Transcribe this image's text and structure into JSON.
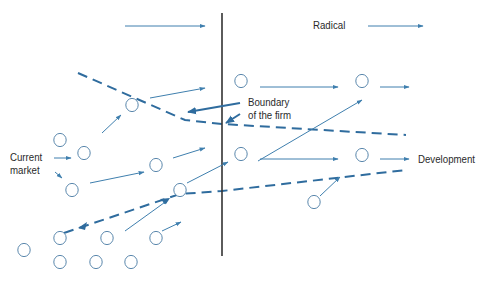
{
  "diagram": {
    "labels": {
      "radical": "Radical",
      "boundary_line1": "Boundary",
      "boundary_line2": "of the firm",
      "current_line1": "Current",
      "current_line2": "market",
      "development": "Development"
    },
    "colors": {
      "arrow": "#3f7fae",
      "dashed": "#2f6c9e",
      "circle": "#5b88ad",
      "boundary_line": "#333333",
      "text": "#2a2a2a"
    },
    "circles": [
      {
        "x": 132,
        "y": 105
      },
      {
        "x": 241,
        "y": 81
      },
      {
        "x": 362,
        "y": 81
      },
      {
        "x": 60,
        "y": 140
      },
      {
        "x": 84,
        "y": 153
      },
      {
        "x": 72,
        "y": 190
      },
      {
        "x": 156,
        "y": 165
      },
      {
        "x": 180,
        "y": 190
      },
      {
        "x": 241,
        "y": 154
      },
      {
        "x": 362,
        "y": 155
      },
      {
        "x": 314,
        "y": 202
      },
      {
        "x": 60,
        "y": 238
      },
      {
        "x": 107,
        "y": 238
      },
      {
        "x": 156,
        "y": 238
      },
      {
        "x": 24,
        "y": 250
      },
      {
        "x": 60,
        "y": 262
      },
      {
        "x": 96,
        "y": 262
      },
      {
        "x": 131,
        "y": 262
      }
    ],
    "arrows": [
      {
        "x1": 125,
        "y1": 26,
        "x2": 205,
        "y2": 26
      },
      {
        "x1": 368,
        "y1": 26,
        "x2": 423,
        "y2": 26
      },
      {
        "x1": 150,
        "y1": 98,
        "x2": 205,
        "y2": 88
      },
      {
        "x1": 102,
        "y1": 133,
        "x2": 121,
        "y2": 115
      },
      {
        "x1": 260,
        "y1": 87,
        "x2": 338,
        "y2": 87
      },
      {
        "x1": 380,
        "y1": 87,
        "x2": 409,
        "y2": 87
      },
      {
        "x1": 54,
        "y1": 158,
        "x2": 71,
        "y2": 158
      },
      {
        "x1": 55,
        "y1": 172,
        "x2": 62,
        "y2": 178
      },
      {
        "x1": 90,
        "y1": 183,
        "x2": 144,
        "y2": 172
      },
      {
        "x1": 173,
        "y1": 158,
        "x2": 205,
        "y2": 148
      },
      {
        "x1": 187,
        "y1": 183,
        "x2": 228,
        "y2": 162
      },
      {
        "x1": 260,
        "y1": 159,
        "x2": 338,
        "y2": 159
      },
      {
        "x1": 380,
        "y1": 159,
        "x2": 409,
        "y2": 159
      },
      {
        "x1": 125,
        "y1": 231,
        "x2": 168,
        "y2": 200
      },
      {
        "x1": 162,
        "y1": 231,
        "x2": 181,
        "y2": 222
      },
      {
        "x1": 320,
        "y1": 196,
        "x2": 340,
        "y2": 177
      },
      {
        "x1": 258,
        "y1": 161,
        "x2": 362,
        "y2": 100
      }
    ],
    "thick_arrows": [
      {
        "x1": 240,
        "y1": 103,
        "x2": 188,
        "y2": 112
      },
      {
        "x1": 240,
        "y1": 114,
        "x2": 226,
        "y2": 123
      }
    ],
    "dashed_lines": [
      {
        "points": "78,73 185,120 222,124 406,135"
      },
      {
        "points": "64,233 180,194 222,191 406,170"
      }
    ],
    "vertical_line": {
      "x": 222,
      "y1": 13,
      "y2": 256
    }
  }
}
